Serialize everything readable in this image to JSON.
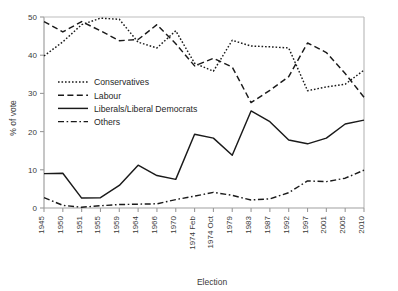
{
  "chart_data": {
    "type": "line",
    "title": "",
    "xlabel": "Election",
    "ylabel": "% of vote",
    "ylim": [
      0,
      50
    ],
    "yticks": [
      0,
      10,
      20,
      30,
      40,
      50
    ],
    "grid": false,
    "legend_position": "inner-left",
    "categories": [
      "1945",
      "1950",
      "1951",
      "1955",
      "1959",
      "1964",
      "1966",
      "1970",
      "1974 Feb",
      "1974 Oct",
      "1979",
      "1983",
      "1987",
      "1992",
      "1997",
      "2001",
      "2005",
      "2010"
    ],
    "series": [
      {
        "name": "Conservatives",
        "style": "dotted",
        "values": [
          39.8,
          43.5,
          48.0,
          49.7,
          49.4,
          43.4,
          41.9,
          46.4,
          37.9,
          35.8,
          43.9,
          42.4,
          42.2,
          41.9,
          30.7,
          31.7,
          32.4,
          36.1
        ]
      },
      {
        "name": "Labour",
        "style": "dashed",
        "values": [
          48.8,
          46.1,
          48.8,
          46.4,
          43.8,
          44.1,
          48.0,
          43.0,
          37.2,
          39.2,
          36.9,
          27.6,
          30.8,
          34.4,
          43.2,
          40.7,
          35.2,
          29.0
        ]
      },
      {
        "name": "Liberals/Liberal Democrats",
        "style": "solid",
        "values": [
          9.0,
          9.1,
          2.6,
          2.7,
          5.9,
          11.2,
          8.5,
          7.5,
          19.3,
          18.3,
          13.8,
          25.4,
          22.6,
          17.8,
          16.8,
          18.3,
          22.0,
          23.0
        ]
      },
      {
        "name": "Others",
        "style": "dash-dot",
        "values": [
          2.7,
          0.7,
          0.2,
          0.6,
          0.9,
          1.0,
          1.1,
          2.2,
          3.1,
          4.1,
          3.3,
          2.1,
          2.4,
          4.0,
          7.1,
          6.9,
          7.8,
          9.9
        ]
      }
    ]
  },
  "axes": {
    "ylabel": "% of vote",
    "xlabel": "Election",
    "ytick_labels": [
      "0",
      "10",
      "20",
      "30",
      "40",
      "50"
    ],
    "xtick_labels": [
      "1945",
      "1950",
      "1951",
      "1955",
      "1959",
      "1964",
      "1966",
      "1970",
      "1974 Feb",
      "1974 Oct",
      "1979",
      "1983",
      "1987",
      "1992",
      "1997",
      "2001",
      "2005",
      "2010"
    ]
  },
  "legend": {
    "items": [
      {
        "label": "Conservatives"
      },
      {
        "label": "Labour"
      },
      {
        "label": "Liberals/Liberal Democrats"
      },
      {
        "label": "Others"
      }
    ]
  },
  "colors": {
    "line": "#1a1a1a",
    "axis": "#9a9a9a",
    "text": "#3a3a3a",
    "background": "#ffffff"
  }
}
